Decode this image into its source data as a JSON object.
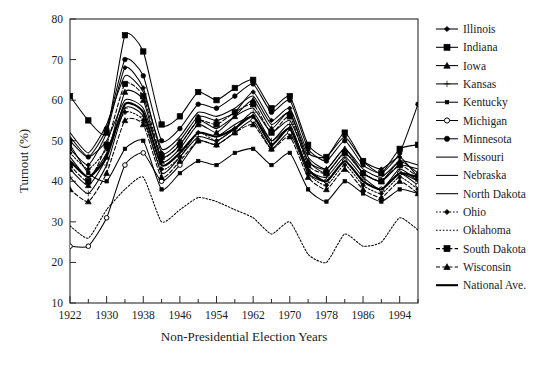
{
  "chart_data": {
    "type": "line",
    "title": "",
    "xlabel": "Non-Presidential Election Years",
    "ylabel": "Turnout (%)",
    "xlim": [
      1922,
      1998
    ],
    "ylim": [
      10,
      80
    ],
    "ytick_step": 10,
    "xtick_major_step": 8,
    "xtick_minor_step": 4,
    "grid": false,
    "legend_position": "right",
    "yticks": [
      "10",
      "20",
      "30",
      "40",
      "50",
      "60",
      "70",
      "80"
    ],
    "xticks": [
      "1922",
      "1930",
      "1938",
      "1946",
      "1954",
      "1962",
      "1970",
      "1978",
      "1986",
      "1994"
    ],
    "x": [
      1922,
      1926,
      1930,
      1934,
      1938,
      1942,
      1946,
      1950,
      1954,
      1958,
      1962,
      1966,
      1970,
      1974,
      1978,
      1982,
      1986,
      1990,
      1994,
      1998
    ],
    "series": [
      {
        "name": "Illinois",
        "marker": "diamond",
        "dash": "none",
        "values": [
          48,
          44,
          52,
          68,
          63,
          47,
          50,
          56,
          55,
          57,
          62,
          55,
          58,
          47,
          46,
          51,
          45,
          43,
          46,
          41
        ]
      },
      {
        "name": "Indiana",
        "marker": "square-filled",
        "dash": "none",
        "values": [
          61,
          55,
          52,
          76,
          72,
          54,
          56,
          62,
          60,
          63,
          65,
          58,
          61,
          49,
          46,
          52,
          45,
          42,
          48,
          49
        ]
      },
      {
        "name": "Iowa",
        "marker": "triangle",
        "dash": "none",
        "values": [
          43,
          39,
          46,
          62,
          60,
          45,
          48,
          54,
          52,
          56,
          60,
          53,
          57,
          45,
          43,
          48,
          42,
          40,
          45,
          42
        ]
      },
      {
        "name": "Kansas",
        "marker": "plus",
        "dash": "none",
        "values": [
          41,
          37,
          44,
          58,
          56,
          42,
          46,
          51,
          50,
          53,
          57,
          50,
          54,
          43,
          41,
          46,
          41,
          38,
          43,
          40
        ]
      },
      {
        "name": "Kentucky",
        "marker": "square-small",
        "dash": "none",
        "values": [
          49,
          42,
          40,
          48,
          50,
          38,
          42,
          45,
          44,
          47,
          48,
          44,
          47,
          38,
          35,
          40,
          37,
          35,
          38,
          37
        ]
      },
      {
        "name": "Michigan",
        "marker": "circle-open",
        "dash": "none",
        "values": [
          24,
          24,
          31,
          44,
          47,
          40,
          44,
          50,
          49,
          52,
          55,
          48,
          52,
          42,
          40,
          45,
          40,
          38,
          42,
          39
        ]
      },
      {
        "name": "Minnesota",
        "marker": "circle-filled",
        "dash": "none",
        "values": [
          50,
          46,
          53,
          70,
          66,
          50,
          53,
          59,
          58,
          61,
          64,
          57,
          60,
          48,
          45,
          50,
          44,
          42,
          47,
          59
        ]
      },
      {
        "name": "Missouri",
        "marker": "none",
        "dash": "none",
        "values": [
          51,
          46,
          50,
          60,
          58,
          46,
          49,
          55,
          53,
          56,
          58,
          52,
          55,
          45,
          42,
          47,
          42,
          40,
          44,
          43
        ]
      },
      {
        "name": "Nebraska",
        "marker": "none",
        "dash": "none",
        "values": [
          46,
          41,
          47,
          59,
          57,
          44,
          47,
          52,
          51,
          54,
          56,
          50,
          53,
          43,
          40,
          45,
          40,
          38,
          42,
          40
        ]
      },
      {
        "name": "North Dakota",
        "marker": "none",
        "dash": "none",
        "values": [
          52,
          47,
          54,
          66,
          62,
          48,
          51,
          57,
          56,
          58,
          61,
          54,
          57,
          46,
          43,
          48,
          43,
          41,
          45,
          44
        ]
      },
      {
        "name": "Ohio",
        "marker": "diamond",
        "dash": "dotted",
        "values": [
          47,
          43,
          48,
          57,
          55,
          43,
          46,
          52,
          50,
          53,
          56,
          49,
          53,
          42,
          39,
          44,
          39,
          37,
          41,
          38
        ]
      },
      {
        "name": "Oklahoma",
        "marker": "none",
        "dash": "dotted",
        "values": [
          29,
          26,
          33,
          38,
          41,
          30,
          33,
          36,
          35,
          33,
          31,
          27,
          30,
          22,
          20,
          27,
          24,
          25,
          31,
          28
        ]
      },
      {
        "name": "South Dakota",
        "marker": "square-filled",
        "dash": "dashed",
        "values": [
          44,
          40,
          49,
          64,
          61,
          46,
          49,
          55,
          54,
          57,
          59,
          52,
          56,
          44,
          42,
          47,
          42,
          40,
          44,
          41
        ]
      },
      {
        "name": "Wisconsin",
        "marker": "triangle",
        "dash": "dashed",
        "values": [
          38,
          35,
          42,
          55,
          54,
          41,
          45,
          50,
          49,
          52,
          54,
          48,
          51,
          41,
          38,
          43,
          38,
          36,
          40,
          37
        ]
      },
      {
        "name": "National Ave.",
        "marker": "none",
        "dash": "none",
        "thick": true,
        "values": [
          45,
          41,
          46,
          59,
          57,
          44,
          47,
          52,
          51,
          53,
          56,
          49,
          53,
          43,
          40,
          45,
          40,
          38,
          42,
          41
        ]
      }
    ]
  },
  "legend": {
    "items": [
      {
        "label": "Illinois"
      },
      {
        "label": "Indiana"
      },
      {
        "label": "Iowa"
      },
      {
        "label": "Kansas"
      },
      {
        "label": "Kentucky"
      },
      {
        "label": "Michigan"
      },
      {
        "label": "Minnesota"
      },
      {
        "label": "Missouri"
      },
      {
        "label": "Nebraska"
      },
      {
        "label": "North Dakota"
      },
      {
        "label": "Ohio"
      },
      {
        "label": "Oklahoma"
      },
      {
        "label": "South Dakota"
      },
      {
        "label": "Wisconsin"
      },
      {
        "label": "National Ave."
      }
    ]
  },
  "colors": {
    "line": "#000000",
    "frame": "#2b2b2b",
    "background": "#ffffff"
  }
}
